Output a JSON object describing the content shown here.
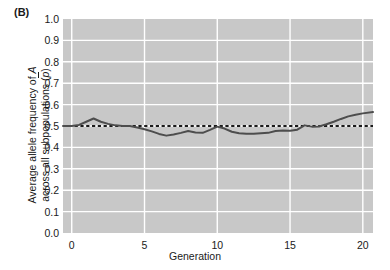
{
  "panel": {
    "label": "(B)"
  },
  "axes": {
    "ylabel_line1": "Average allele frequency of A",
    "ylabel_line2_prefix": "across all subpopulations (",
    "ylabel_line2_var": "p",
    "ylabel_line2_suffix": ")",
    "xlabel": "Generation"
  },
  "style": {
    "plot_bg": "#c8c8c8",
    "gridline": "#ffffff",
    "data_line": "#4d4d4d",
    "reference_line": "#1a1a1a",
    "text": "#1a1a1a",
    "page_bg": "#ffffff"
  },
  "chart_data": {
    "type": "line",
    "title": "",
    "xlabel": "Generation",
    "ylabel": "Average allele frequency of A across all subpopulations (p̄)",
    "xlim": [
      -0.6,
      20.7
    ],
    "ylim": [
      0.0,
      1.0
    ],
    "grid": true,
    "legend": "none",
    "xticks": [
      0,
      5,
      10,
      15,
      20
    ],
    "ytick_labels": [
      "0.0",
      "0.1",
      "0.2",
      "0.3",
      "0.4",
      "0.5",
      "0.6",
      "0.7",
      "0.8",
      "0.9",
      "1.0"
    ],
    "yticks": [
      0.0,
      0.1,
      0.2,
      0.3,
      0.4,
      0.5,
      0.6,
      0.7,
      0.8,
      0.9,
      1.0
    ],
    "reference": {
      "label": "p = 0.5",
      "y": 0.5,
      "dash": true
    },
    "series": [
      {
        "name": "Average allele frequency of A",
        "x": [
          -0.6,
          0.0,
          0.5,
          1.0,
          1.5,
          2.0,
          2.5,
          3.0,
          3.5,
          4.0,
          4.5,
          5.0,
          5.5,
          6.0,
          6.5,
          7.0,
          7.5,
          8.0,
          8.5,
          9.0,
          9.5,
          10.0,
          10.5,
          11.0,
          11.5,
          12.0,
          12.5,
          13.0,
          13.5,
          14.0,
          14.5,
          15.0,
          15.5,
          16.0,
          16.5,
          17.0,
          17.5,
          18.0,
          18.5,
          19.0,
          19.5,
          20.0,
          20.7
        ],
        "values": [
          0.5,
          0.5,
          0.505,
          0.52,
          0.535,
          0.52,
          0.51,
          0.503,
          0.5,
          0.5,
          0.493,
          0.485,
          0.475,
          0.463,
          0.455,
          0.46,
          0.468,
          0.477,
          0.47,
          0.468,
          0.482,
          0.497,
          0.488,
          0.473,
          0.466,
          0.464,
          0.464,
          0.466,
          0.468,
          0.477,
          0.479,
          0.478,
          0.483,
          0.503,
          0.497,
          0.498,
          0.508,
          0.52,
          0.533,
          0.545,
          0.553,
          0.559,
          0.565
        ]
      }
    ]
  },
  "geometry": {
    "plot_left": 63,
    "plot_right": 373,
    "plot_top": 19,
    "plot_bottom": 233
  }
}
